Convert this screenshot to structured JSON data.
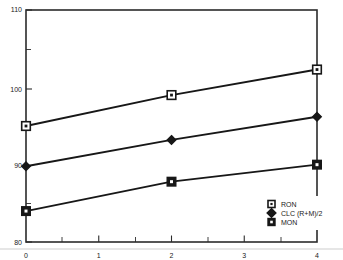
{
  "chart_data": {
    "type": "line",
    "title": "",
    "subtitle": "",
    "xlabel": "",
    "ylabel": "",
    "xlim": [
      0,
      4
    ],
    "ylim": [
      80,
      110
    ],
    "x": [
      0,
      2,
      4
    ],
    "xticks": [
      "0",
      "1",
      "2",
      "3",
      "4"
    ],
    "yticks": [
      "80",
      "90",
      "100",
      "110"
    ],
    "grid": false,
    "legend_position": "bottom-right",
    "series": [
      {
        "name": "RON",
        "marker": "open-square",
        "values": [
          95.0,
          99.0,
          102.3
        ]
      },
      {
        "name": "CLC (R+M)/2",
        "marker": "filled-diamond",
        "values": [
          89.8,
          93.2,
          96.2
        ]
      },
      {
        "name": "MON",
        "marker": "filled-square",
        "values": [
          84.0,
          87.8,
          90.0
        ]
      }
    ]
  },
  "axes": {
    "y_labels": [
      "110",
      "100",
      "90",
      "80"
    ],
    "x_labels": [
      "0",
      "1",
      "2",
      "3",
      "4"
    ]
  },
  "legend": {
    "entries": [
      {
        "label": "RON"
      },
      {
        "label": "CLC (R+M)/2"
      },
      {
        "label": "MON"
      }
    ]
  },
  "colors": {
    "line": "#171717",
    "frame": "#2b2b2b",
    "text": "#1a1a1a",
    "background": "#ffffff"
  }
}
